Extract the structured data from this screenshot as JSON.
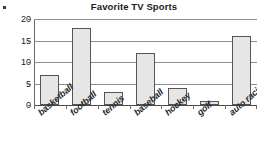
{
  "chart_data": {
    "type": "bar",
    "title": "Favorite TV Sports",
    "xlabel": "",
    "ylabel": "",
    "categories": [
      "basketball",
      "football",
      "tennis",
      "baseball",
      "hockey",
      "golf",
      "auto racing"
    ],
    "values": [
      7,
      18,
      3,
      12,
      4,
      1,
      16
    ],
    "ylim": [
      0,
      20
    ],
    "yticks": [
      0,
      5,
      10,
      15,
      20
    ],
    "ytick_labels": [
      "0",
      "5",
      "10",
      "15",
      "20"
    ],
    "grid": true,
    "legend": false,
    "bar_fill_color": "#e6e6e6",
    "bar_border_color": "#555555",
    "gridline_color": "#8d8d8d",
    "axis_color": "#4a4a4a",
    "text_color": "#1a1a1a",
    "background_color": "#ffffff"
  }
}
